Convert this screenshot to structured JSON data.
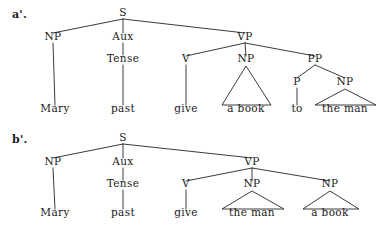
{
  "figure": {
    "background_color": "#ffffff",
    "line_color": "#262626",
    "text_color": "#1a1a1a"
  },
  "panels": [
    {
      "id": "a-prime",
      "label": "a'.",
      "sentence": "Mary past give a book to the man",
      "nodes": [
        {
          "name": "s",
          "label": "S",
          "x": 123,
          "y": 16
        },
        {
          "name": "np-subj",
          "label": "NP",
          "x": 53,
          "y": 40
        },
        {
          "name": "aux",
          "label": "Aux",
          "x": 123,
          "y": 40
        },
        {
          "name": "vp",
          "label": "VP",
          "x": 245,
          "y": 40
        },
        {
          "name": "tense",
          "label": "Tense",
          "x": 123,
          "y": 62
        },
        {
          "name": "v",
          "label": "V",
          "x": 186,
          "y": 62
        },
        {
          "name": "np-obj",
          "label": "NP",
          "x": 246,
          "y": 62
        },
        {
          "name": "pp",
          "label": "PP",
          "x": 315,
          "y": 62
        },
        {
          "name": "p",
          "label": "P",
          "x": 297,
          "y": 85
        },
        {
          "name": "np-pobj",
          "label": "NP",
          "x": 345,
          "y": 85
        }
      ],
      "terminals": [
        {
          "name": "terminal-mary",
          "label": "Mary",
          "x": 55,
          "y": 112
        },
        {
          "name": "terminal-past",
          "label": "past",
          "x": 123,
          "y": 112
        },
        {
          "name": "terminal-give",
          "label": "give",
          "x": 186,
          "y": 112
        },
        {
          "name": "terminal-a-book",
          "label": "a book",
          "x": 246,
          "y": 112
        },
        {
          "name": "terminal-to",
          "label": "to",
          "x": 297,
          "y": 112
        },
        {
          "name": "terminal-the-man",
          "label": "the man",
          "x": 345,
          "y": 112
        }
      ],
      "edges": [
        {
          "name": "edge-s-np",
          "x1": 123,
          "y1": 19,
          "x2": 53,
          "y2": 33
        },
        {
          "name": "edge-s-aux",
          "x1": 123,
          "y1": 19,
          "x2": 123,
          "y2": 33
        },
        {
          "name": "edge-s-vp",
          "x1": 123,
          "y1": 19,
          "x2": 245,
          "y2": 33
        },
        {
          "name": "edge-np-mary",
          "x1": 53,
          "y1": 43,
          "x2": 55,
          "y2": 105
        },
        {
          "name": "edge-aux-tense",
          "x1": 123,
          "y1": 43,
          "x2": 123,
          "y2": 55
        },
        {
          "name": "edge-tense-past",
          "x1": 123,
          "y1": 65,
          "x2": 123,
          "y2": 105
        },
        {
          "name": "edge-vp-v",
          "x1": 245,
          "y1": 43,
          "x2": 186,
          "y2": 56
        },
        {
          "name": "edge-vp-np",
          "x1": 245,
          "y1": 43,
          "x2": 246,
          "y2": 56
        },
        {
          "name": "edge-vp-pp",
          "x1": 245,
          "y1": 43,
          "x2": 315,
          "y2": 56
        },
        {
          "name": "edge-v-give",
          "x1": 186,
          "y1": 65,
          "x2": 186,
          "y2": 105
        },
        {
          "name": "edge-pp-p",
          "x1": 315,
          "y1": 65,
          "x2": 297,
          "y2": 78
        },
        {
          "name": "edge-pp-np",
          "x1": 315,
          "y1": 65,
          "x2": 345,
          "y2": 78
        },
        {
          "name": "edge-p-to",
          "x1": 297,
          "y1": 88,
          "x2": 297,
          "y2": 105
        }
      ],
      "triangles": [
        {
          "name": "triangle-a-book",
          "apex_x": 246,
          "apex_y": 66,
          "left_x": 222,
          "right_x": 271,
          "base_y": 105
        },
        {
          "name": "triangle-the-man",
          "apex_x": 345,
          "apex_y": 89,
          "left_x": 315,
          "right_x": 376,
          "base_y": 105
        }
      ],
      "label_x": 12,
      "label_y": 18
    },
    {
      "id": "b-prime",
      "label": "b'.",
      "sentence": "Mary past give the man a book",
      "nodes": [
        {
          "name": "s",
          "label": "S",
          "x": 123,
          "y": 141
        },
        {
          "name": "np-subj",
          "label": "NP",
          "x": 53,
          "y": 165
        },
        {
          "name": "aux",
          "label": "Aux",
          "x": 123,
          "y": 165
        },
        {
          "name": "vp",
          "label": "VP",
          "x": 252,
          "y": 165
        },
        {
          "name": "tense",
          "label": "Tense",
          "x": 123,
          "y": 187
        },
        {
          "name": "v",
          "label": "V",
          "x": 186,
          "y": 187
        },
        {
          "name": "np-io",
          "label": "NP",
          "x": 252,
          "y": 187
        },
        {
          "name": "np-do",
          "label": "NP",
          "x": 330,
          "y": 187
        }
      ],
      "terminals": [
        {
          "name": "terminal-mary",
          "label": "Mary",
          "x": 55,
          "y": 216
        },
        {
          "name": "terminal-past",
          "label": "past",
          "x": 123,
          "y": 216
        },
        {
          "name": "terminal-give",
          "label": "give",
          "x": 186,
          "y": 216
        },
        {
          "name": "terminal-the-man",
          "label": "the man",
          "x": 252,
          "y": 216
        },
        {
          "name": "terminal-a-book",
          "label": "a book",
          "x": 330,
          "y": 216
        }
      ],
      "edges": [
        {
          "name": "edge-s-np",
          "x1": 123,
          "y1": 144,
          "x2": 53,
          "y2": 158
        },
        {
          "name": "edge-s-aux",
          "x1": 123,
          "y1": 144,
          "x2": 123,
          "y2": 158
        },
        {
          "name": "edge-s-vp",
          "x1": 123,
          "y1": 144,
          "x2": 252,
          "y2": 158
        },
        {
          "name": "edge-np-mary",
          "x1": 53,
          "y1": 168,
          "x2": 55,
          "y2": 209
        },
        {
          "name": "edge-aux-tense",
          "x1": 123,
          "y1": 168,
          "x2": 123,
          "y2": 180
        },
        {
          "name": "edge-tense-past",
          "x1": 123,
          "y1": 190,
          "x2": 123,
          "y2": 209
        },
        {
          "name": "edge-vp-v",
          "x1": 252,
          "y1": 168,
          "x2": 186,
          "y2": 181
        },
        {
          "name": "edge-vp-np-io",
          "x1": 252,
          "y1": 168,
          "x2": 252,
          "y2": 181
        },
        {
          "name": "edge-vp-np-do",
          "x1": 252,
          "y1": 168,
          "x2": 330,
          "y2": 181
        },
        {
          "name": "edge-v-give",
          "x1": 186,
          "y1": 190,
          "x2": 186,
          "y2": 209
        }
      ],
      "triangles": [
        {
          "name": "triangle-the-man",
          "apex_x": 252,
          "apex_y": 191,
          "left_x": 222,
          "right_x": 284,
          "base_y": 209
        },
        {
          "name": "triangle-a-book",
          "apex_x": 330,
          "apex_y": 191,
          "left_x": 303,
          "right_x": 359,
          "base_y": 209
        }
      ],
      "label_x": 12,
      "label_y": 143
    }
  ]
}
